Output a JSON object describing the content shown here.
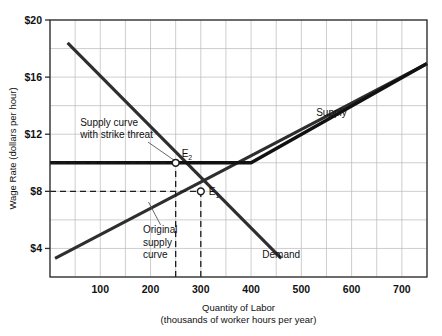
{
  "chart_data": {
    "type": "line",
    "title": "",
    "xlabel": "Quantity of Labor",
    "xlabel_sub": "(thousands of worker hours per year)",
    "ylabel": "Wage Rate (dollars per hour)",
    "xlim": [
      0,
      750
    ],
    "ylim": [
      2,
      20
    ],
    "grid": true,
    "x_major_ticks": [
      100,
      200,
      300,
      400,
      500,
      600,
      700
    ],
    "x_major_tick_labels": [
      "100",
      "200",
      "300",
      "400",
      "500",
      "600",
      "700"
    ],
    "x_grid_step": 50,
    "y_major_ticks": [
      4,
      8,
      12,
      16,
      20
    ],
    "y_major_tick_labels": [
      "$4",
      "$8",
      "$12",
      "$16",
      "$20"
    ],
    "y_grid_step": 2,
    "legend_position": "inline-labels",
    "series": [
      {
        "name": "Demand",
        "label": "Demand",
        "label_x": 460,
        "label_y": 3.35,
        "points": [
          [
            35,
            18.4
          ],
          [
            460,
            3.3
          ]
        ]
      },
      {
        "name": "Supply",
        "label": "Supply",
        "label_x": 560,
        "label_y": 13.3,
        "points": [
          [
            10,
            3.3
          ],
          [
            750,
            16.95
          ]
        ]
      },
      {
        "name": "Supply curve with strike threat",
        "label": "",
        "points": [
          [
            0,
            10.0
          ],
          [
            400,
            10.0
          ],
          [
            750,
            16.95
          ]
        ]
      }
    ],
    "annotations": [
      {
        "name": "strike-threat-label",
        "lines": [
          "Supply curve",
          "with strike threat"
        ],
        "x": 60,
        "y": 12.6,
        "leader_from": [
          195,
          11.45
        ],
        "leader_to": [
          248,
          10.15
        ]
      },
      {
        "name": "original-supply-label",
        "lines": [
          "Original",
          "supply",
          "curve"
        ],
        "x": 185,
        "y": 5.05,
        "leader_from": [
          220,
          5.65
        ],
        "leader_to": [
          196,
          7.25
        ]
      }
    ],
    "equilibria": [
      {
        "name": "E2",
        "label": "E",
        "sublabel": "2",
        "x": 250,
        "y": 10.0,
        "label_dx": 6,
        "label_dy": -6,
        "guides": [
          {
            "type": "vertical",
            "from_y": 2,
            "to_y": 10.0
          },
          {
            "type": "horizontal",
            "from_x": 0,
            "to_x": 250
          }
        ]
      },
      {
        "name": "E1",
        "label": "E",
        "sublabel": "1",
        "x": 300,
        "y": 8.0,
        "label_dx": 8,
        "label_dy": 4,
        "guides": [
          {
            "type": "vertical",
            "from_y": 2,
            "to_y": 8.0
          },
          {
            "type": "horizontal",
            "from_x": 0,
            "to_x": 300
          }
        ]
      }
    ],
    "colors": {
      "curve": "#2e2e2e",
      "strike_curve": "#111111",
      "grid": "#b9b9b9",
      "frame": "#2b2b2b",
      "text": "#111111",
      "background": "#ffffff"
    }
  }
}
